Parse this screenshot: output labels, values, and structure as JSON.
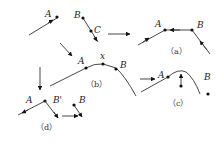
{
  "diagram": {
    "panels": {
      "initial": {
        "labels": [
          "A",
          "B",
          "C"
        ]
      },
      "a": {
        "caption": "（a）",
        "labels": [
          "A",
          "B"
        ]
      },
      "b": {
        "caption": "（b）",
        "labels": [
          "A",
          "x",
          "B"
        ]
      },
      "c": {
        "caption": "（c）",
        "labels": [
          "A",
          "B"
        ]
      },
      "d": {
        "caption": "（d）",
        "labels": [
          "A",
          "B'",
          "B"
        ]
      }
    },
    "colors": {
      "stroke": "#333333",
      "dot": "#111111",
      "background": "#ffffff"
    }
  }
}
